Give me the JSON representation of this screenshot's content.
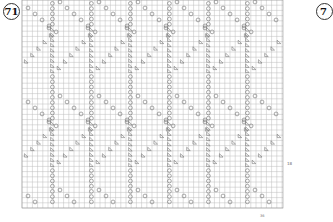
{
  "chart": {
    "number": "71",
    "next_number_partial": "7",
    "row_label": "18",
    "col_label": "36",
    "grid": {
      "x0": 22,
      "y0": 0,
      "x1": 283,
      "y1": 208,
      "cell": 5.2,
      "line_color": "#bdbdbd",
      "symbol_color": "#6e6e6e"
    },
    "pattern": {
      "repeat_width": 39,
      "repeat_starts": [
        16,
        55,
        94,
        133,
        172,
        211,
        250
      ],
      "band_height": 94,
      "band_starts": [
        -20,
        74,
        168
      ],
      "symbols": {
        "yarn_over": "circle",
        "decrease": "triangle"
      }
    }
  }
}
